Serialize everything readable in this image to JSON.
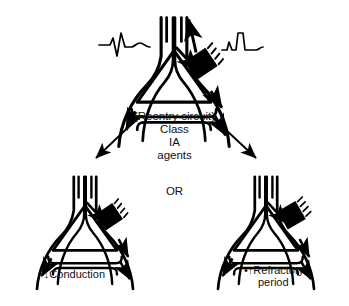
{
  "figure": {
    "type": "medical-diagram",
    "background_color": "#ffffff",
    "ink_color": "#000000"
  },
  "center_text": {
    "reentry": "(Reentry circuit)",
    "class": "Class",
    "ia": "IA",
    "agents": "agents",
    "or": "OR"
  },
  "labels": {
    "left_outcome": "•↓Conduction",
    "right_outcome_line1": "•↑Refractory",
    "right_outcome_line2": "period"
  },
  "panels": [
    {
      "id": "top",
      "name": "reentry-circuit-heart",
      "position": "top-center",
      "block_style": "unidirectional-block",
      "ecg_left": "qrs-complex",
      "ecg_right": "qrs-complex"
    },
    {
      "id": "bottom-left",
      "name": "decreased-conduction-heart",
      "position": "bottom-left",
      "block_style": "bidirectional-block",
      "outcome": "•↓Conduction"
    },
    {
      "id": "bottom-right",
      "name": "increased-refractory-heart",
      "position": "bottom-right",
      "block_style": "refractory-block",
      "outcome": "•↑Refractory period"
    }
  ],
  "arrows": {
    "left_branch": "diagonal-arrow-down-left",
    "right_branch": "diagonal-arrow-down-right"
  }
}
